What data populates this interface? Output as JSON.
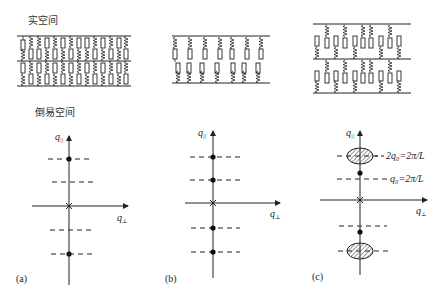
{
  "labels": {
    "real_space": "实空间",
    "reciprocal_space": "倒易空间"
  },
  "axes": {
    "q_parallel": "q",
    "q_parallel_sub": "||",
    "q_perp": "q",
    "q_perp_sub": "⊥"
  },
  "panels": [
    {
      "id": "a",
      "label": "(a)",
      "real_space": {
        "layers": 2,
        "description": "densely packed chains with resistor and spring elements between three horizontal lines"
      },
      "reciprocal": {
        "dots": 2,
        "dashed_lines": 4
      }
    },
    {
      "id": "b",
      "label": "(b)",
      "real_space": {
        "layers": 1,
        "description": "single layer of chains connected in series between two horizontal lines"
      },
      "reciprocal": {
        "dots": 4,
        "dashed_lines": 4
      }
    },
    {
      "id": "c",
      "label": "(c)",
      "real_space": {
        "layers": 2,
        "description": "two layers of chains with staggered spring/resistor elements"
      },
      "reciprocal": {
        "dots": 2,
        "ellipses": 2,
        "dashed_lines": 4,
        "annotation_upper": "2q₀=2π/L",
        "annotation_lower": "q₀=2π/L"
      }
    }
  ],
  "colors": {
    "ink": "#222222",
    "hatch": "#333333",
    "background": "#ffffff"
  }
}
